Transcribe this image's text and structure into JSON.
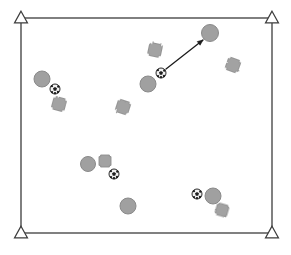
{
  "scene": {
    "title": "Spatial scene with agents, balls and obstacles",
    "canvas": {
      "width": 291,
      "height": 255
    },
    "background_color": "#ffffff"
  },
  "frame": {
    "name": "field-boundary",
    "x": 21,
    "y": 18,
    "width": 251,
    "height": 215,
    "stroke_color": "#4a4a4a",
    "stroke_width": 1.4,
    "fill": "none"
  },
  "corner_markers": {
    "shape": "triangle",
    "stroke_color": "#3d3d3d",
    "fill_color": "#ffffff",
    "stroke_width": 1.2,
    "size": 13,
    "items": [
      {
        "label": "corner-marker-top-left",
        "cx": 21,
        "cy": 18
      },
      {
        "label": "corner-marker-top-right",
        "cx": 272,
        "cy": 18
      },
      {
        "label": "corner-marker-bottom-left",
        "cx": 21,
        "cy": 233
      },
      {
        "label": "corner-marker-bottom-right",
        "cx": 272,
        "cy": 233
      }
    ]
  },
  "circles": {
    "label": "gray-disc",
    "fill_color": "#a0a0a0",
    "stroke_color": "#8a8a8a",
    "stroke_width": 1,
    "items": [
      {
        "id": "disc-1",
        "cx": 210,
        "cy": 33,
        "r": 8.5
      },
      {
        "id": "disc-2",
        "cx": 148,
        "cy": 84,
        "r": 8
      },
      {
        "id": "disc-3",
        "cx": 42,
        "cy": 79,
        "r": 8
      },
      {
        "id": "disc-4",
        "cx": 88,
        "cy": 164,
        "r": 7.5
      },
      {
        "id": "disc-5",
        "cx": 128,
        "cy": 206,
        "r": 8
      },
      {
        "id": "disc-6",
        "cx": 213,
        "cy": 196,
        "r": 8
      }
    ]
  },
  "soccer_balls": {
    "label": "soccer-ball",
    "fill_color": "#f2f2f2",
    "stroke_color": "#2b2b2b",
    "patch_color": "#1f1f1f",
    "items": [
      {
        "id": "ball-1",
        "cx": 161,
        "cy": 73,
        "r": 5
      },
      {
        "id": "ball-2",
        "cx": 55,
        "cy": 89,
        "r": 5
      },
      {
        "id": "ball-3",
        "cx": 114,
        "cy": 174,
        "r": 5
      },
      {
        "id": "ball-4",
        "cx": 197,
        "cy": 194,
        "r": 5
      }
    ]
  },
  "crosses": {
    "label": "cross-obstacle",
    "fill_color": "#a2a2a2",
    "stroke_color": "#8c8c8c",
    "stroke_width": 0.9,
    "items": [
      {
        "id": "cross-1",
        "cx": 155,
        "cy": 50,
        "size": 13,
        "arm": 4.6,
        "rot": 12,
        "rough": true
      },
      {
        "id": "cross-2",
        "cx": 233,
        "cy": 65,
        "size": 13,
        "arm": 4.6,
        "rot": 20,
        "rough": true
      },
      {
        "id": "cross-3",
        "cx": 59,
        "cy": 104,
        "size": 13,
        "arm": 4.6,
        "rot": 15,
        "rough": true
      },
      {
        "id": "cross-4",
        "cx": 123,
        "cy": 107,
        "size": 13,
        "arm": 4.6,
        "rot": 18,
        "rough": true
      },
      {
        "id": "cross-5",
        "cx": 105,
        "cy": 161,
        "size": 12,
        "arm": 4.4,
        "rot": 0,
        "rough": false
      },
      {
        "id": "cross-6",
        "cx": 222,
        "cy": 210,
        "size": 12,
        "arm": 4.4,
        "rot": 16,
        "rough": true
      }
    ]
  },
  "arrows": {
    "label": "motion-arrow",
    "stroke_color": "#1c1c1c",
    "stroke_width": 1.3,
    "items": [
      {
        "id": "arrow-1",
        "from": {
          "x": 166,
          "y": 69
        },
        "to": {
          "x": 203,
          "y": 40
        },
        "head_size": 5.5,
        "source": "ball-1",
        "target": "disc-1"
      }
    ]
  }
}
